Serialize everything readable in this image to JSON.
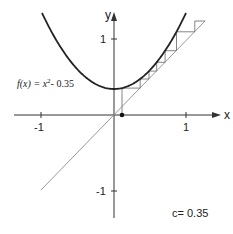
{
  "diagram": {
    "type": "cobweb-plot",
    "function_label": {
      "prefix": "f(x) = x",
      "exponent": "2",
      "suffix": "- 0.35"
    },
    "parameter_label": "c= 0.35",
    "axes": {
      "x_label": "x",
      "y_label": "y",
      "x_ticks": [
        {
          "label": "-1",
          "value": -1
        },
        {
          "label": "1",
          "value": 1
        }
      ],
      "y_ticks": [
        {
          "label": "1",
          "value": 1
        },
        {
          "label": "-1",
          "value": -1
        }
      ]
    },
    "curve": {
      "equation": "x^2 - c",
      "c": 0.35,
      "color": "#222222"
    },
    "diagonal": {
      "equation": "y = x",
      "color": "#999999"
    },
    "cobweb": {
      "x0": 0.11,
      "color": "#777777"
    },
    "fixed_point_dot": {
      "x": 0.11,
      "y": 0
    }
  }
}
